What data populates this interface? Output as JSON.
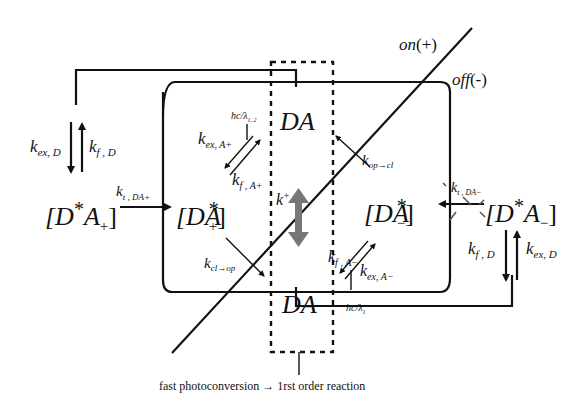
{
  "diagram": {
    "labels": {
      "on": "on",
      "on_sign": "(+)",
      "off": "off",
      "off_sign": "(-)",
      "bottom_caption": "fast photoconversion → 1rst order reaction"
    },
    "states": {
      "DA_top": {
        "base": "DA"
      },
      "DA_bottom": {
        "base": "DA"
      },
      "D_star_A_plus": {
        "left": "[D",
        "star": "*",
        "mid": "A",
        "sub": "+",
        "right": "]"
      },
      "DA_star_plus": {
        "left": "[DA",
        "star": "*",
        "sub": "+",
        "right": "]"
      },
      "DA_star_minus": {
        "left": "[DA",
        "star": "*",
        "sub": "−",
        "right": "]"
      },
      "D_star_A_minus": {
        "left": "[D",
        "star": "*",
        "mid": "A",
        "sub": "−",
        "right": "]"
      }
    },
    "rates": {
      "k_ex_D_left": {
        "k": "k",
        "sub": "ex, D"
      },
      "k_f_D_left": {
        "k": "k",
        "sub": "f , D"
      },
      "k_t_DA_plus": {
        "k": "k",
        "sub": "t , DA+"
      },
      "k_ex_A_plus": {
        "k": "k",
        "sub": "ex, A+"
      },
      "k_f_A_plus": {
        "k": "k",
        "sub": "f , A+"
      },
      "hc_lambda_12": {
        "text": "hc/λ",
        "sub": "1, 2"
      },
      "k_plus": {
        "k": "k",
        "sup": "+"
      },
      "k_op_cl": {
        "k": "k",
        "sub": "op→cl"
      },
      "k_cl_op": {
        "k": "k",
        "sub": "cl→op"
      },
      "k_t_DA_minus": {
        "k": "k",
        "sub": "t , DA−"
      },
      "k_f_A_minus": {
        "k": "k",
        "sub": "f , A−"
      },
      "k_ex_A_minus": {
        "k": "k",
        "sub": "ex, A−"
      },
      "hc_lambda_1": {
        "text": "hc/λ",
        "sub": "1"
      },
      "k_f_D_right": {
        "k": "k",
        "sub": "f , D"
      },
      "k_ex_D_right": {
        "k": "k",
        "sub": "ex, D"
      }
    },
    "colors": {
      "ink": "#111111",
      "gray_arrow": "#777777",
      "background": "#ffffff"
    }
  }
}
